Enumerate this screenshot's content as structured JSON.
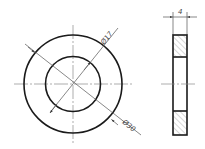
{
  "drawing": {
    "front_view": {
      "outer_diameter_label": "Ø30",
      "inner_diameter_label": "Ø17"
    },
    "side_view": {
      "thickness_label": "4"
    }
  },
  "colors": {
    "outline": "#1a1a1a",
    "centerline": "#8a8a8a",
    "dimension": "#555555",
    "background": "#ffffff"
  }
}
